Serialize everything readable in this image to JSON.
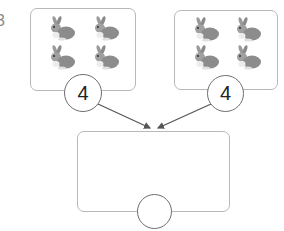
{
  "question": {
    "number": "3"
  },
  "groups": [
    {
      "name": "left-group",
      "item": "rabbit",
      "count_shown": 4,
      "circle_value": "4"
    },
    {
      "name": "right-group",
      "item": "rabbit",
      "count_shown": 4,
      "circle_value": "4"
    }
  ],
  "total": {
    "circle_value": ""
  },
  "colors": {
    "box_border": "#b8b8b8",
    "circle_border": "#6e6e6e",
    "arrow": "#555555",
    "rabbit": "#8c8c8c"
  }
}
